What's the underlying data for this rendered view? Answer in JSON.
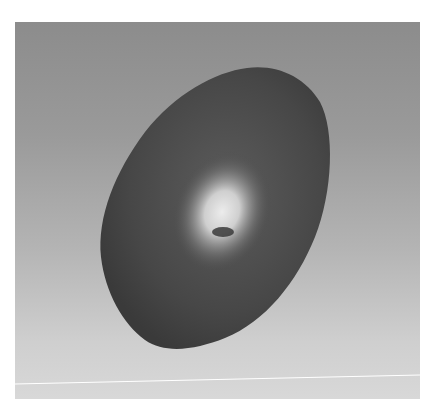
{
  "image": {
    "subject": "dark ovoid object with bright central highlight",
    "style": "grayscale",
    "colors": {
      "background_top": "#8c8c8c",
      "background_bottom": "#d8d8d8",
      "object_dark": "#3e3e3e",
      "object_mid": "#555555",
      "highlight": "#e6e6e6",
      "line": "#ffffff"
    }
  }
}
